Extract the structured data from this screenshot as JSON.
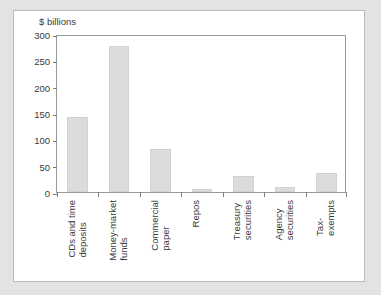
{
  "chart_data": {
    "type": "bar",
    "title": "",
    "subtitle": "",
    "xlabel": "",
    "ylabel": "$ billions",
    "unit_caption": "$ billions",
    "categories": [
      "CDs and time deposits",
      "Money-market funds",
      "Commercial paper",
      "Repos",
      "Treasury securities",
      "Agency securities",
      "Tax-exempts"
    ],
    "category_lines": [
      "CDs and time\ndeposits",
      "Money-market\nfunds",
      "Commercial\npaper",
      "Repos",
      "Treasury\nsecurities",
      "Agency\nsecurities",
      "Tax-\nexempts"
    ],
    "values": [
      143,
      277,
      82,
      5,
      30,
      10,
      36
    ],
    "ylim": [
      0,
      300
    ],
    "yticks": [
      0,
      50,
      100,
      150,
      200,
      250,
      300
    ],
    "ytick_labels": [
      "0",
      "50",
      "100",
      "150",
      "200",
      "250",
      "300"
    ],
    "grid": false,
    "legend": null,
    "bar_color": "#dcdcdc",
    "bar_border_color": "#d2d2d2",
    "axis_color": "#9a9a98",
    "text_color": "#3a3a3a",
    "panel_background": "#ffffff",
    "page_background": "#e3e3e1"
  }
}
